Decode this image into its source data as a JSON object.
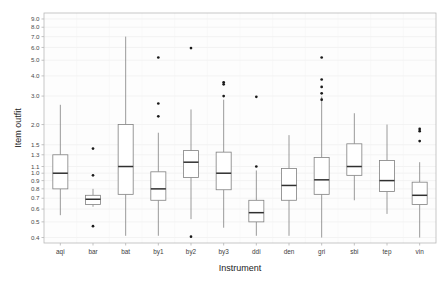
{
  "chart_data": {
    "type": "box",
    "title": "",
    "xlabel": "Instrument",
    "ylabel": "Item outfit",
    "yscale": "log",
    "ylim": [
      0.37,
      9.8
    ],
    "grid": true,
    "legend": "none",
    "ytick_labels": [
      "9.0",
      "8.0",
      "7.0",
      "6.0",
      "5.0",
      "4.0",
      "3.0",
      "2.0",
      "1.5",
      "1.3",
      "1.1",
      "1.0",
      "0.9",
      "0.8",
      "0.7",
      "0.6",
      "0.5",
      "0.4"
    ],
    "ytick_values": [
      9.0,
      8.0,
      7.0,
      6.0,
      5.0,
      4.0,
      3.0,
      2.0,
      1.5,
      1.3,
      1.1,
      1.0,
      0.9,
      0.8,
      0.7,
      0.6,
      0.5,
      0.4
    ],
    "categories": [
      "aqi",
      "bar",
      "bat",
      "by1",
      "by2",
      "by3",
      "ddi",
      "den",
      "gri",
      "sbi",
      "tep",
      "vin"
    ],
    "boxes": [
      {
        "category": "aqi",
        "whisker_low": 0.55,
        "q1": 0.8,
        "median": 1.0,
        "q3": 1.3,
        "whisker_high": 2.65,
        "outliers": []
      },
      {
        "category": "bar",
        "whisker_low": 0.62,
        "q1": 0.64,
        "median": 0.69,
        "q3": 0.73,
        "whisker_high": 0.8,
        "outliers": [
          1.42,
          0.97,
          0.47
        ]
      },
      {
        "category": "bat",
        "whisker_low": 0.41,
        "q1": 0.74,
        "median": 1.1,
        "q3": 2.0,
        "whisker_high": 7.0,
        "outliers": []
      },
      {
        "category": "by1",
        "whisker_low": 0.41,
        "q1": 0.68,
        "median": 0.8,
        "q3": 1.02,
        "whisker_high": 1.78,
        "outliers": [
          5.2,
          2.7,
          2.25
        ]
      },
      {
        "category": "by2",
        "whisker_low": 0.52,
        "q1": 0.94,
        "median": 1.17,
        "q3": 1.38,
        "whisker_high": 2.48,
        "outliers": [
          5.95,
          0.405
        ]
      },
      {
        "category": "by3",
        "whisker_low": 0.46,
        "q1": 0.79,
        "median": 1.0,
        "q3": 1.35,
        "whisker_high": 2.85,
        "outliers": [
          3.65,
          3.55,
          3.0
        ]
      },
      {
        "category": "ddi",
        "whisker_low": 0.41,
        "q1": 0.5,
        "median": 0.57,
        "q3": 0.68,
        "whisker_high": 1.04,
        "outliers": [
          2.97,
          1.1
        ]
      },
      {
        "category": "den",
        "whisker_low": 0.41,
        "q1": 0.68,
        "median": 0.84,
        "q3": 1.07,
        "whisker_high": 1.72,
        "outliers": []
      },
      {
        "category": "gri",
        "whisker_low": 0.4,
        "q1": 0.74,
        "median": 0.91,
        "q3": 1.25,
        "whisker_high": 2.98,
        "outliers": [
          5.2,
          3.8,
          3.42,
          3.12,
          2.85
        ]
      },
      {
        "category": "sbi",
        "whisker_low": 0.68,
        "q1": 0.97,
        "median": 1.1,
        "q3": 1.52,
        "whisker_high": 2.35,
        "outliers": []
      },
      {
        "category": "tep",
        "whisker_low": 0.56,
        "q1": 0.77,
        "median": 0.9,
        "q3": 1.2,
        "whisker_high": 2.0,
        "outliers": []
      },
      {
        "category": "vin",
        "whisker_low": 0.4,
        "q1": 0.64,
        "median": 0.73,
        "q3": 0.88,
        "whisker_high": 1.17,
        "outliers": [
          1.88,
          1.82,
          1.58
        ]
      }
    ]
  },
  "colors": {
    "box_fill": "#ffffff",
    "box_stroke": "#808080",
    "median": "#303030",
    "outlier": "#1a1a1a",
    "grid": "#ededed",
    "panel_border": "#b9b9b9",
    "background": "#fdfdfd",
    "text": "#3d3d3d"
  }
}
